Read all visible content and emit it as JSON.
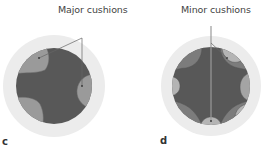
{
  "panels": [
    {
      "id": "c",
      "letter": "c",
      "callout": "Major cushions",
      "outer_color": "#ececec",
      "inner_color": "#585858",
      "cushion_color": "#999999"
    },
    {
      "id": "d",
      "letter": "d",
      "callout": "Minor cushions",
      "outer_color": "#ececec",
      "inner_color": "#585858",
      "mid_color": "#7a7a7a",
      "cushion_color": "#a8a8a8"
    }
  ]
}
